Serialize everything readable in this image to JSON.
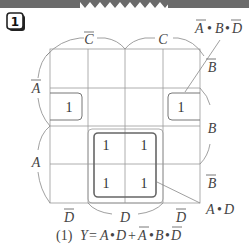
{
  "header": {
    "bar_color": "#6b6b6b",
    "problem_number": "1"
  },
  "kmap": {
    "column_labels_top": [
      {
        "text": "C",
        "overline": true
      },
      {
        "text": "C",
        "overline": false
      }
    ],
    "column_labels_bottom": [
      {
        "text": "D",
        "overline": true
      },
      {
        "text": "D",
        "overline": false
      },
      {
        "text": "D",
        "overline": true
      }
    ],
    "row_labels_left": [
      {
        "text": "A",
        "overline": true
      },
      {
        "text": "A",
        "overline": false
      }
    ],
    "row_labels_right": [
      {
        "text": "B",
        "overline": true
      },
      {
        "text": "B",
        "overline": false
      },
      {
        "text": "B",
        "overline": true
      }
    ],
    "cells": [
      [
        "",
        "",
        "",
        ""
      ],
      [
        "1",
        "",
        "",
        "1"
      ],
      [
        "",
        "1",
        "1",
        ""
      ],
      [
        "",
        "1",
        "1",
        ""
      ]
    ],
    "groups": [
      {
        "term": "A•D",
        "label_parts": [
          {
            "t": "A",
            "o": false
          },
          {
            "t": "•",
            "o": false
          },
          {
            "t": "D",
            "o": false
          }
        ]
      },
      {
        "term": "A̅•B•D̅",
        "label_parts": [
          {
            "t": "A",
            "o": true
          },
          {
            "t": "•",
            "o": false
          },
          {
            "t": "B",
            "o": false
          },
          {
            "t": "•",
            "o": false
          },
          {
            "t": "D",
            "o": true
          }
        ]
      }
    ]
  },
  "result": {
    "prefix": "(1)",
    "lhs": "Y",
    "equals": "=",
    "terms": [
      "A•D",
      "+",
      "A̅•B•D̅"
    ]
  }
}
